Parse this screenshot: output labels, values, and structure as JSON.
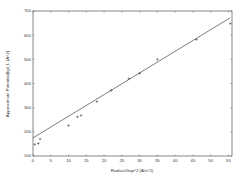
{
  "chart_data": {
    "type": "scatter",
    "title": "",
    "xlabel": "Radius/Gap^2 (A/s^2)",
    "ylabel": "Approximate Potential(kpl_L (A^2)",
    "xlim": [
      0,
      56
    ],
    "ylim": [
      100,
      700
    ],
    "xticks": [
      0,
      5,
      10,
      15,
      20,
      25,
      30,
      35,
      40,
      45,
      50,
      55
    ],
    "yticks": [
      100,
      200,
      300,
      400,
      500,
      600,
      700
    ],
    "grid": false,
    "legend": null,
    "series": [
      {
        "name": "data",
        "marker": "+",
        "x": [
          0.5,
          1.5,
          2,
          10,
          12.5,
          13.5,
          18,
          22,
          27,
          30,
          35,
          46,
          55.5
        ],
        "y": [
          148,
          152,
          170,
          226,
          262,
          268,
          325,
          372,
          420,
          442,
          500,
          582,
          648
        ]
      },
      {
        "name": "linear fit",
        "style": "line",
        "x": [
          0,
          55.5
        ],
        "y": [
          175,
          672
        ]
      }
    ]
  }
}
